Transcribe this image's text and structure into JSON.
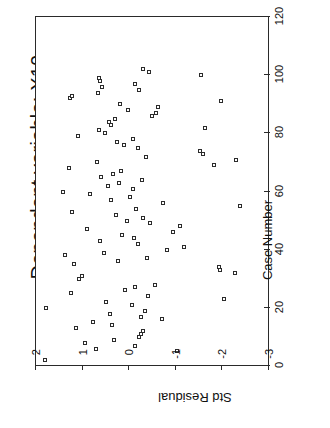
{
  "chart_data": {
    "type": "scatter",
    "title": "Dependent variable: X10",
    "xlabel": "Case Number",
    "ylabel": "Std Residual",
    "xlim": [
      0,
      120
    ],
    "ylim": [
      -3,
      2
    ],
    "xticks": [
      0,
      20,
      40,
      60,
      80,
      100,
      120
    ],
    "yticks": [
      2,
      1,
      0,
      -1,
      -2,
      -3
    ],
    "xtick_labels": [
      "0",
      "20",
      "40",
      "60",
      "80",
      "100",
      "120"
    ],
    "ytick_labels": [
      "2",
      "1",
      "0",
      "-1",
      "-2",
      "-3"
    ],
    "grid": false,
    "legend": null,
    "marker": "open-square",
    "rotation_note": "chart rendered rotated 90 degrees counter-clockwise",
    "series": [
      {
        "name": "Std Residual",
        "points": [
          [
            2,
            1.8
          ],
          [
            5,
            -1.02
          ],
          [
            6,
            0.72
          ],
          [
            7,
            -0.12
          ],
          [
            8,
            0.95
          ],
          [
            9,
            0.33
          ],
          [
            10,
            -0.2
          ],
          [
            11,
            -0.26
          ],
          [
            12,
            -0.29
          ],
          [
            13,
            1.15
          ],
          [
            14,
            0.36
          ],
          [
            15,
            0.78
          ],
          [
            16,
            -0.7
          ],
          [
            17,
            -0.25
          ],
          [
            18,
            0.42
          ],
          [
            19,
            -0.33
          ],
          [
            20,
            1.78
          ],
          [
            21,
            -0.05
          ],
          [
            22,
            0.5
          ],
          [
            23,
            -2.04
          ],
          [
            24,
            -0.4
          ],
          [
            25,
            1.25
          ],
          [
            26,
            0.08
          ],
          [
            27,
            -0.12
          ],
          [
            28,
            -0.55
          ],
          [
            30,
            1.08
          ],
          [
            31,
            1.02
          ],
          [
            32,
            -2.28
          ],
          [
            33,
            -1.95
          ],
          [
            34,
            -1.92
          ],
          [
            35,
            1.18
          ],
          [
            36,
            0.23
          ],
          [
            37,
            -0.38
          ],
          [
            38,
            1.38
          ],
          [
            39,
            0.55
          ],
          [
            40,
            -0.82
          ],
          [
            41,
            -1.18
          ],
          [
            42,
            -0.18
          ],
          [
            43,
            0.62
          ],
          [
            44,
            -0.1
          ],
          [
            45,
            0.15
          ],
          [
            46,
            -0.95
          ],
          [
            47,
            0.9
          ],
          [
            48,
            -1.1
          ],
          [
            49,
            -0.45
          ],
          [
            50,
            0.05
          ],
          [
            51,
            -0.3
          ],
          [
            52,
            0.28
          ],
          [
            53,
            1.22
          ],
          [
            54,
            -0.15
          ],
          [
            55,
            -2.38
          ],
          [
            56,
            -0.72
          ],
          [
            57,
            0.4
          ],
          [
            58,
            -0.02
          ],
          [
            59,
            0.85
          ],
          [
            60,
            1.42
          ],
          [
            61,
            -0.08
          ],
          [
            62,
            0.46
          ],
          [
            63,
            0.22
          ],
          [
            64,
            -0.28
          ],
          [
            65,
            0.6
          ],
          [
            66,
            0.34
          ],
          [
            67,
            0.18
          ],
          [
            68,
            1.3
          ],
          [
            69,
            -1.82
          ],
          [
            70,
            0.7
          ],
          [
            71,
            -2.3
          ],
          [
            72,
            -0.35
          ],
          [
            73,
            -1.58
          ],
          [
            74,
            -1.52
          ],
          [
            75,
            -0.18
          ],
          [
            76,
            0.12
          ],
          [
            77,
            0.26
          ],
          [
            78,
            -0.08
          ],
          [
            79,
            1.1
          ],
          [
            80,
            0.52
          ],
          [
            81,
            0.65
          ],
          [
            82,
            -1.62
          ],
          [
            83,
            0.38
          ],
          [
            84,
            0.44
          ],
          [
            85,
            0.3
          ],
          [
            86,
            -0.48
          ],
          [
            87,
            -0.58
          ],
          [
            88,
            0.02
          ],
          [
            89,
            -0.62
          ],
          [
            90,
            0.2
          ],
          [
            91,
            -1.98
          ],
          [
            92,
            1.28
          ],
          [
            93,
            1.22
          ],
          [
            94,
            0.68
          ],
          [
            95,
            -0.22
          ],
          [
            96,
            0.58
          ],
          [
            97,
            -0.12
          ],
          [
            98,
            0.62
          ],
          [
            99,
            0.64
          ],
          [
            100,
            -1.55
          ],
          [
            101,
            -0.42
          ],
          [
            102,
            -0.3
          ]
        ]
      }
    ]
  },
  "chart": {
    "title": "Dependent variable: X10",
    "case_axis_title": "Case Number",
    "residual_axis_title": "Std Residual",
    "case_ticks": [
      {
        "value": 0,
        "label": "0"
      },
      {
        "value": 20,
        "label": "20"
      },
      {
        "value": 40,
        "label": "40"
      },
      {
        "value": 60,
        "label": "60"
      },
      {
        "value": 80,
        "label": "80"
      },
      {
        "value": 100,
        "label": "100"
      },
      {
        "value": 120,
        "label": "120"
      }
    ],
    "residual_ticks": [
      {
        "value": 2,
        "label": "2"
      },
      {
        "value": 1,
        "label": "1"
      },
      {
        "value": 0,
        "label": "0"
      },
      {
        "value": -1,
        "label": "-1"
      },
      {
        "value": -2,
        "label": "-2"
      },
      {
        "value": -3,
        "label": "-3"
      }
    ],
    "colors": {
      "axis": "#2a2a2a",
      "marker_stroke": "#2b2b2b",
      "marker_fill": "#ffffff",
      "background": "#ffffff",
      "text": "#111111"
    }
  }
}
